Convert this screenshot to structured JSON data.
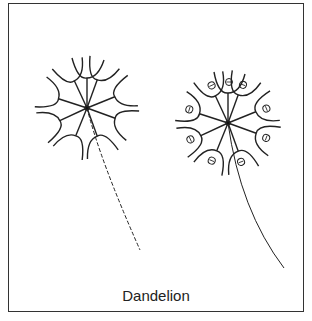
{
  "caption": "Dandelion",
  "figures": [
    {
      "name": "dandelion-seedhead-empty",
      "center": [
        87,
        108
      ],
      "stalk": "dashed"
    },
    {
      "name": "dandelion-seedhead-with-seeds",
      "center": [
        228,
        123
      ],
      "stalk": "solid"
    }
  ],
  "colors": {
    "stroke": "#222222",
    "border": "#333333"
  }
}
